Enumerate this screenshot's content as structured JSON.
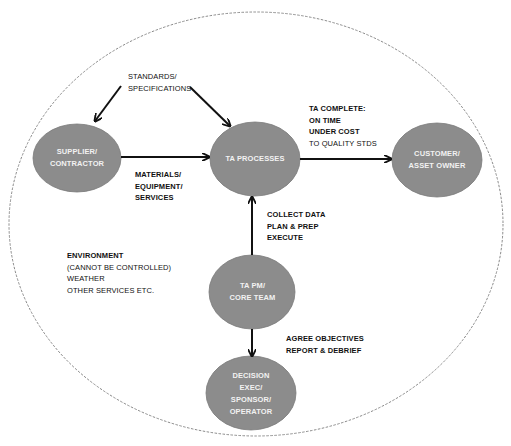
{
  "diagram": {
    "title": "",
    "colors": {
      "node_fill": "#8c8c8c",
      "node_stroke": "#7a7a7a",
      "node_text": "#f2f2f2",
      "arrow": "#111111",
      "boundary": "#8a8a8a",
      "background": "#ffffff"
    },
    "boundary": {
      "shape": "dashed-ellipse",
      "meaning": "environment boundary"
    },
    "nodes": {
      "supplier": {
        "lines": [
          "SUPPLIER/",
          "CONTRACTOR"
        ]
      },
      "processes": {
        "lines": [
          "TA PROCESSES"
        ]
      },
      "customer": {
        "lines": [
          "CUSTOMER/",
          "ASSET OWNER"
        ]
      },
      "core_team": {
        "lines": [
          "TA PM/",
          "CORE TEAM"
        ]
      },
      "decision": {
        "lines": [
          "DECISION",
          "EXEC/",
          "SPONSOR/",
          "OPERATOR"
        ]
      }
    },
    "annotations": {
      "standards": {
        "lines": [
          "STANDARDS/",
          "SPECIFICATIONS"
        ]
      },
      "materials": {
        "lines": [
          "MATERIALS/",
          "EQUIPMENT/",
          "SERVICES"
        ]
      },
      "ta_complete": {
        "lines": [
          "TA COMPLETE:",
          "ON TIME",
          "UNDER COST",
          "TO QUALITY STDS"
        ]
      },
      "collect": {
        "lines": [
          "COLLECT DATA",
          "PLAN & PREP",
          "EXECUTE"
        ]
      },
      "agree": {
        "lines": [
          "AGREE OBJECTIVES",
          "REPORT & DEBRIEF"
        ]
      },
      "environment": {
        "lines": [
          "ENVIRONMENT",
          "(CANNOT BE CONTROLLED)",
          "WEATHER",
          "OTHER SERVICES ETC."
        ]
      }
    },
    "edges": [
      {
        "from": "standards",
        "to": "supplier",
        "label": ""
      },
      {
        "from": "standards",
        "to": "processes",
        "label": ""
      },
      {
        "from": "supplier",
        "to": "processes",
        "label": "MATERIALS/ EQUIPMENT/ SERVICES"
      },
      {
        "from": "processes",
        "to": "customer",
        "label": "TA COMPLETE: ON TIME UNDER COST TO QUALITY STDS"
      },
      {
        "from": "core_team",
        "to": "processes",
        "label": "COLLECT DATA PLAN & PREP EXECUTE"
      },
      {
        "from": "core_team",
        "to": "decision",
        "label": "AGREE OBJECTIVES REPORT & DEBRIEF"
      }
    ]
  }
}
